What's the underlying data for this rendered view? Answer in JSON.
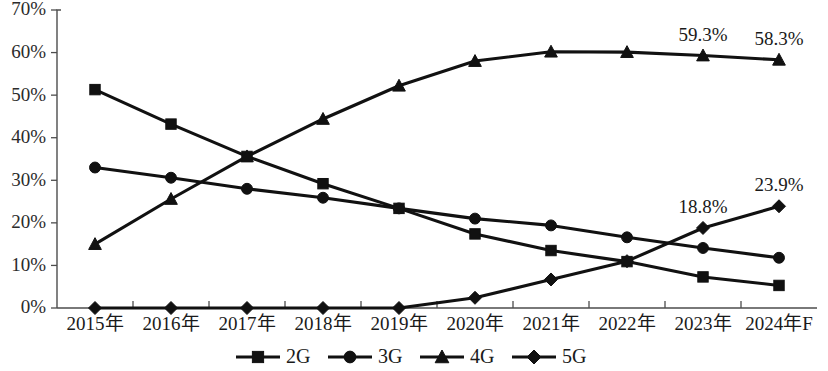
{
  "chart_data": {
    "type": "line",
    "title": "",
    "subtitle": "",
    "xlabel": "",
    "ylabel": "",
    "grid": false,
    "legend_position": "bottom",
    "ylim": [
      0,
      70
    ],
    "ytick_labels": [
      "0%",
      "10%",
      "20%",
      "30%",
      "40%",
      "50%",
      "60%",
      "70%"
    ],
    "ytick_values": [
      0,
      10,
      20,
      30,
      40,
      50,
      60,
      70
    ],
    "categories": [
      "2015年",
      "2016年",
      "2017年",
      "2018年",
      "2019年",
      "2020年",
      "2021年",
      "2022年",
      "2023年",
      "2024年F"
    ],
    "series": [
      {
        "name": "2G",
        "marker": "square",
        "values": [
          51.3,
          43.2,
          35.6,
          29.2,
          23.4,
          17.4,
          13.5,
          10.9,
          7.3,
          5.3
        ]
      },
      {
        "name": "3G",
        "marker": "circle",
        "values": [
          33.0,
          30.6,
          28.0,
          25.9,
          23.4,
          21.0,
          19.4,
          16.6,
          14.1,
          11.8
        ]
      },
      {
        "name": "4G",
        "marker": "triangle",
        "values": [
          15.0,
          25.6,
          35.6,
          44.4,
          52.2,
          58.0,
          60.2,
          60.1,
          59.3,
          58.3
        ]
      },
      {
        "name": "5G",
        "marker": "diamond",
        "values": [
          0.0,
          0.0,
          0.0,
          0.0,
          0.0,
          2.4,
          6.7,
          11.0,
          18.8,
          23.9
        ]
      }
    ],
    "annotations": [
      {
        "series": "4G",
        "category": "2023年",
        "text": "59.3%"
      },
      {
        "series": "4G",
        "category": "2024年F",
        "text": "58.3%"
      },
      {
        "series": "5G",
        "category": "2023年",
        "text": "18.8%"
      },
      {
        "series": "5G",
        "category": "2024年F",
        "text": "23.9%"
      }
    ],
    "colors": {
      "series_stroke": "#111111",
      "axis": "#4d4d4d",
      "text": "#1a1a1a",
      "background": "#ffffff"
    }
  }
}
